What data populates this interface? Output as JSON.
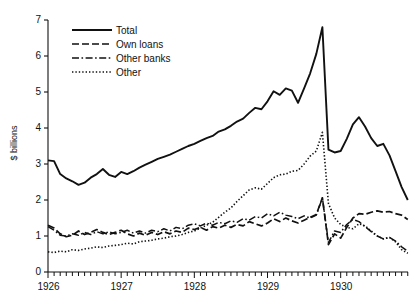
{
  "chart_data": {
    "type": "line",
    "title": "",
    "xlabel": "",
    "ylabel": "$ billions",
    "xlim": [
      1926.0,
      1930.92
    ],
    "ylim": [
      0,
      7
    ],
    "yticks": [
      0,
      1,
      2,
      3,
      4,
      5,
      6,
      7
    ],
    "ytick_labels": [
      "0",
      "1",
      "2",
      "3",
      "4",
      "5",
      "6",
      "7"
    ],
    "xticks": [
      1926,
      1927,
      1928,
      1929,
      1930
    ],
    "xtick_labels": [
      "1926",
      "1927",
      "1928",
      "1929",
      "1930"
    ],
    "minor_xticks": "monthly",
    "grid": false,
    "legend_position": "upper-left-inside",
    "x": [
      1926.0,
      1926.083,
      1926.167,
      1926.25,
      1926.333,
      1926.417,
      1926.5,
      1926.583,
      1926.667,
      1926.75,
      1926.833,
      1926.917,
      1927.0,
      1927.083,
      1927.167,
      1927.25,
      1927.333,
      1927.417,
      1927.5,
      1927.583,
      1927.667,
      1927.75,
      1927.833,
      1927.917,
      1928.0,
      1928.083,
      1928.167,
      1928.25,
      1928.333,
      1928.417,
      1928.5,
      1928.583,
      1928.667,
      1928.75,
      1928.833,
      1928.917,
      1929.0,
      1929.083,
      1929.167,
      1929.25,
      1929.333,
      1929.417,
      1929.5,
      1929.583,
      1929.667,
      1929.75,
      1929.833,
      1929.917,
      1930.0,
      1930.083,
      1930.167,
      1930.25,
      1930.333,
      1930.417,
      1930.5,
      1930.583,
      1930.667,
      1930.75,
      1930.833,
      1930.917
    ],
    "series": [
      {
        "name": "Total",
        "style": "solid",
        "values": [
          3.1,
          3.08,
          2.72,
          2.6,
          2.52,
          2.42,
          2.48,
          2.62,
          2.72,
          2.86,
          2.7,
          2.64,
          2.78,
          2.72,
          2.8,
          2.9,
          2.98,
          3.06,
          3.14,
          3.2,
          3.26,
          3.34,
          3.42,
          3.5,
          3.56,
          3.64,
          3.72,
          3.78,
          3.9,
          3.96,
          4.06,
          4.18,
          4.26,
          4.42,
          4.56,
          4.52,
          4.74,
          5.02,
          4.92,
          5.1,
          5.04,
          4.7,
          5.1,
          5.52,
          6.06,
          6.8,
          3.4,
          3.32,
          3.36,
          3.7,
          4.1,
          4.3,
          4.04,
          3.72,
          3.5,
          3.56,
          3.24,
          2.8,
          2.36,
          2.0
        ]
      },
      {
        "name": "Own loans",
        "style": "dashed",
        "values": [
          1.3,
          1.22,
          1.06,
          0.98,
          1.02,
          1.14,
          1.04,
          1.1,
          1.18,
          1.1,
          1.04,
          1.1,
          1.16,
          1.06,
          1.0,
          1.08,
          1.02,
          1.1,
          1.04,
          1.12,
          1.06,
          1.14,
          1.1,
          1.22,
          1.18,
          1.24,
          1.16,
          1.26,
          1.22,
          1.3,
          1.24,
          1.32,
          1.28,
          1.4,
          1.34,
          1.28,
          1.36,
          1.48,
          1.4,
          1.5,
          1.42,
          1.36,
          1.44,
          1.52,
          1.6,
          2.06,
          0.76,
          1.06,
          0.94,
          1.24,
          1.5,
          1.62,
          1.6,
          1.66,
          1.7,
          1.66,
          1.68,
          1.62,
          1.58,
          1.46
        ]
      },
      {
        "name": "Other banks",
        "style": "dashdot",
        "values": [
          1.26,
          1.16,
          1.02,
          1.0,
          1.06,
          1.02,
          1.1,
          1.04,
          1.12,
          1.06,
          1.12,
          1.06,
          1.1,
          1.16,
          1.08,
          1.14,
          1.08,
          1.16,
          1.12,
          1.2,
          1.14,
          1.24,
          1.2,
          1.3,
          1.34,
          1.28,
          1.36,
          1.3,
          1.38,
          1.34,
          1.42,
          1.38,
          1.48,
          1.44,
          1.54,
          1.5,
          1.62,
          1.56,
          1.66,
          1.58,
          1.54,
          1.48,
          1.56,
          1.5,
          1.58,
          2.06,
          0.82,
          1.14,
          1.1,
          1.32,
          1.46,
          1.4,
          1.26,
          1.12,
          1.0,
          0.92,
          0.96,
          0.86,
          0.7,
          0.58
        ]
      },
      {
        "name": "Other",
        "style": "dotted",
        "values": [
          0.56,
          0.54,
          0.58,
          0.56,
          0.62,
          0.6,
          0.64,
          0.66,
          0.7,
          0.68,
          0.72,
          0.74,
          0.76,
          0.8,
          0.78,
          0.84,
          0.86,
          0.88,
          0.92,
          0.94,
          0.98,
          1.0,
          1.04,
          1.1,
          1.14,
          1.22,
          1.3,
          1.38,
          1.52,
          1.66,
          1.78,
          1.96,
          2.12,
          2.28,
          2.34,
          2.3,
          2.46,
          2.62,
          2.7,
          2.72,
          2.8,
          2.82,
          3.0,
          3.22,
          3.36,
          3.88,
          1.9,
          1.5,
          1.32,
          1.24,
          1.2,
          1.34,
          1.28,
          1.14,
          1.0,
          0.92,
          0.96,
          0.84,
          0.62,
          0.52
        ]
      }
    ]
  },
  "legend": {
    "items": [
      {
        "label": "Total"
      },
      {
        "label": "Own loans"
      },
      {
        "label": "Other banks"
      },
      {
        "label": "Other"
      }
    ]
  }
}
